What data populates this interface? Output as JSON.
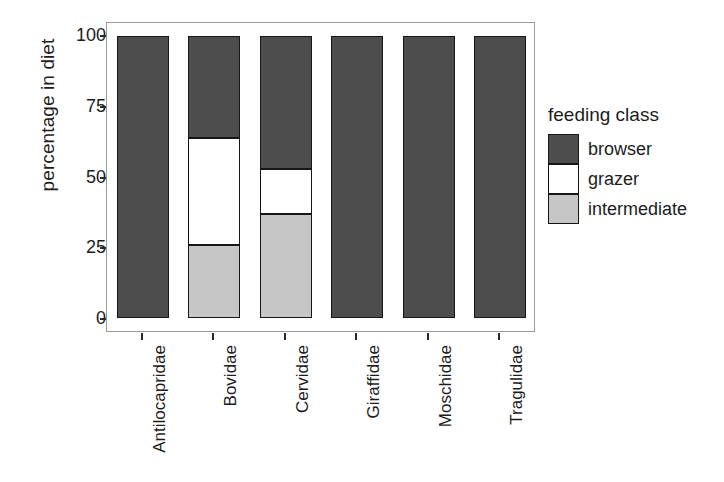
{
  "chart_data": {
    "type": "bar",
    "stacked": true,
    "title": "",
    "xlabel": "",
    "ylabel": "percentage in diet",
    "ylim": [
      0,
      100
    ],
    "yticks": [
      0,
      25,
      50,
      75,
      100
    ],
    "ytick_labels": [
      "0",
      "25",
      "50",
      "75",
      "100"
    ],
    "grid": false,
    "legend_position": "right",
    "legend_title": "feeding class",
    "categories": [
      "Antilocapridae",
      "Bovidae",
      "Cervidae",
      "Giraffidae",
      "Moschidae",
      "Tragulidae"
    ],
    "series": [
      {
        "name": "browser",
        "color": "#4d4d4d",
        "values": [
          100,
          36,
          47,
          100,
          100,
          100
        ]
      },
      {
        "name": "grazer",
        "color": "#ffffff",
        "values": [
          0,
          38,
          16,
          0,
          0,
          0
        ]
      },
      {
        "name": "intermediate",
        "color": "#c6c6c6",
        "values": [
          0,
          26,
          37,
          0,
          0,
          0
        ]
      }
    ]
  },
  "axes": {
    "y_title": "percentage in diet",
    "y_tick_0": "0",
    "y_tick_25": "25",
    "y_tick_50": "50",
    "y_tick_75": "75",
    "y_tick_100": "100",
    "x_label_0": "Antilocapridae",
    "x_label_1": "Bovidae",
    "x_label_2": "Cervidae",
    "x_label_3": "Giraffidae",
    "x_label_4": "Moschidae",
    "x_label_5": "Tragulidae"
  },
  "legend": {
    "title": "feeding class",
    "items": [
      {
        "label": "browser",
        "color": "#4d4d4d"
      },
      {
        "label": "grazer",
        "color": "#ffffff"
      },
      {
        "label": "intermediate",
        "color": "#c6c6c6"
      }
    ]
  },
  "colors": {
    "browser": "#4d4d4d",
    "grazer": "#ffffff",
    "intermediate": "#c6c6c6",
    "panel_border": "#9a9a9a",
    "bar_outline": "#161616",
    "text": "#1c1c1c",
    "background": "#ffffff"
  }
}
